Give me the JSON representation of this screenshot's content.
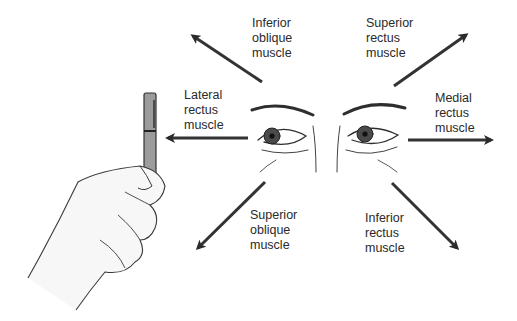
{
  "diagram": {
    "colors": {
      "arrow": "#2b2b2b",
      "line": "#3a3a3a",
      "pen": "#9a9a9a",
      "text": "#2a2a2a"
    },
    "labels": [
      {
        "id": "inferior-oblique",
        "lines": [
          "Inferior",
          "oblique",
          "muscle"
        ],
        "x": 252,
        "y": 16
      },
      {
        "id": "superior-rectus",
        "lines": [
          "Superior",
          "rectus",
          "muscle"
        ],
        "x": 366,
        "y": 16
      },
      {
        "id": "lateral-rectus",
        "lines": [
          "Lateral",
          "rectus",
          "muscle"
        ],
        "x": 184,
        "y": 88
      },
      {
        "id": "medial-rectus",
        "lines": [
          "Medial",
          "rectus",
          "muscle"
        ],
        "x": 435,
        "y": 91
      },
      {
        "id": "superior-oblique",
        "lines": [
          "Superior",
          "oblique",
          "muscle"
        ],
        "x": 250,
        "y": 208
      },
      {
        "id": "inferior-rectus",
        "lines": [
          "Inferior",
          "rectus",
          "muscle"
        ],
        "x": 365,
        "y": 211
      }
    ],
    "arrows": [
      {
        "id": "inferior-oblique-arrow",
        "from": [
          262,
          82
        ],
        "to": [
          193,
          36
        ]
      },
      {
        "id": "superior-rectus-arrow",
        "from": [
          394,
          86
        ],
        "to": [
          466,
          35
        ]
      },
      {
        "id": "lateral-rectus-arrow",
        "from": [
          248,
          138
        ],
        "to": [
          168,
          138
        ]
      },
      {
        "id": "medial-rectus-arrow",
        "from": [
          408,
          140
        ],
        "to": [
          491,
          140
        ]
      },
      {
        "id": "superior-oblique-arrow",
        "from": [
          265,
          182
        ],
        "to": [
          198,
          248
        ]
      },
      {
        "id": "inferior-rectus-arrow",
        "from": [
          392,
          183
        ],
        "to": [
          457,
          248
        ]
      }
    ],
    "illustrations": [
      "hand-holding-pen",
      "patient-eyes"
    ]
  }
}
